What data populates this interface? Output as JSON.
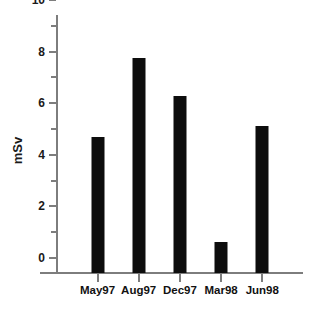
{
  "chart": {
    "type": "bar",
    "ylabel": "mSv",
    "title": "",
    "xlabel": ""
  },
  "chart_data": {
    "type": "bar",
    "title": "",
    "xlabel": "",
    "ylabel": "mSv",
    "categories": [
      "May97",
      "Aug97",
      "Dec97",
      "Mar98",
      "Jun98"
    ],
    "values": [
      5.27,
      8.33,
      6.86,
      1.2,
      5.7
    ],
    "ylim": [
      0,
      10
    ],
    "ytick_values": [
      0,
      2,
      4,
      6,
      8,
      10
    ],
    "ytick_labels": [
      "0",
      "2",
      "4",
      "6",
      "8",
      "10"
    ],
    "yminor_tick_values": [
      1,
      3,
      5,
      7,
      9
    ],
    "grid": false,
    "legend": null,
    "bar_color": "#0d0d0d",
    "axis_color": "#7d7d7d",
    "background_color": "#ffffff"
  }
}
